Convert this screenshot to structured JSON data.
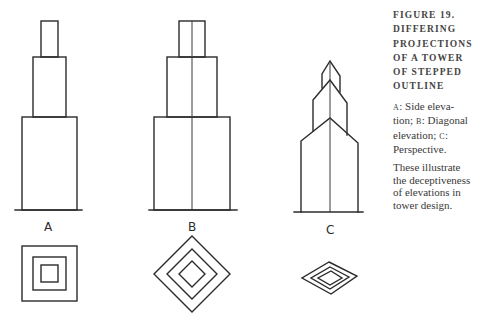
{
  "caption": {
    "title_lines": [
      "FIGURE 19.",
      "DIFFERING",
      "PROJECTIONS",
      "OF A TOWER",
      "OF STEPPED",
      "OUTLINE"
    ],
    "legend": [
      {
        "key": "A",
        "text": "Side elevation"
      },
      {
        "key": "B",
        "text": "Diagonal elevation"
      },
      {
        "key": "C",
        "text": "Perspective."
      }
    ],
    "legend_lines": [
      "Side eleva-",
      "tion;",
      "Diagonal",
      "elevation;",
      "Perspective."
    ],
    "note_lines": [
      "These illustrate",
      "the deceptiveness",
      "of elevations in",
      "tower design."
    ]
  },
  "drawings": [
    {
      "label": "A",
      "projection": "Side elevation"
    },
    {
      "label": "B",
      "projection": "Diagonal elevation"
    },
    {
      "label": "C",
      "projection": "Perspective"
    }
  ],
  "colors": {
    "line": "#2b2b2b",
    "background": "#ffffff",
    "text": "#3a3a3a"
  }
}
